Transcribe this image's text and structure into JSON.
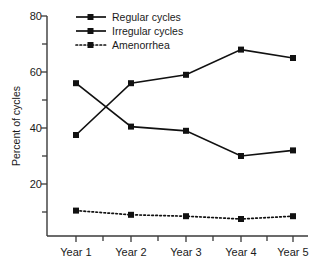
{
  "chart_data": {
    "type": "line",
    "title": "",
    "xlabel": "",
    "ylabel": "Percent of cycles",
    "categories": [
      "Year 1",
      "Year 2",
      "Year 3",
      "Year 4",
      "Year 5"
    ],
    "ylim": [
      0,
      80
    ],
    "yticks": [
      20,
      40,
      60,
      80
    ],
    "yticks_minor": [
      10,
      30,
      50,
      70
    ],
    "grid": false,
    "legend_position": "top-center",
    "series": [
      {
        "name": "Regular cycles",
        "values": [
          37.5,
          56,
          59,
          68,
          65
        ],
        "line_style": "solid",
        "marker": "square",
        "color": "#111111"
      },
      {
        "name": "Irregular cycles",
        "values": [
          56,
          40.5,
          39,
          30,
          32
        ],
        "line_style": "solid",
        "marker": "square",
        "color": "#111111"
      },
      {
        "name": "Amenorrhea",
        "values": [
          10.5,
          9,
          8.5,
          7.5,
          8.5
        ],
        "line_style": "dotted",
        "marker": "square",
        "color": "#111111"
      }
    ]
  },
  "axis": {
    "y_tick_labels": [
      "80",
      "60",
      "40",
      "20"
    ],
    "y_axis_title": "Percent of cycles",
    "x_tick_labels": [
      "Year 1",
      "Year 2",
      "Year 3",
      "Year 4",
      "Year 5"
    ]
  },
  "legend": {
    "items": [
      {
        "label": "Regular cycles"
      },
      {
        "label": "Irregular cycles"
      },
      {
        "label": "Amenorrhea"
      }
    ]
  }
}
